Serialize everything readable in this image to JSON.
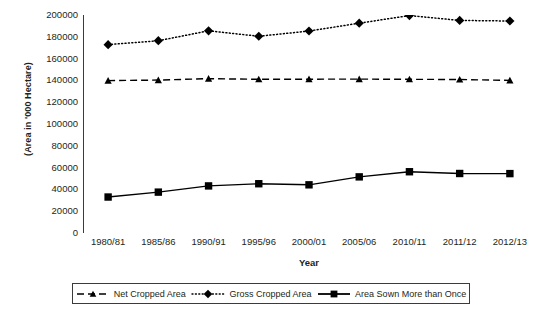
{
  "chart_data": {
    "type": "line",
    "title": "",
    "xlabel": "Year",
    "ylabel": "(Area in '000 Hectare)",
    "categories": [
      "1980/81",
      "1985/86",
      "1990/91",
      "1995/96",
      "2000/01",
      "2005/06",
      "2010/11",
      "2011/12",
      "2012/13"
    ],
    "ylim": [
      0,
      200000
    ],
    "ytick_step": 20000,
    "yticks": [
      "0",
      "20000",
      "40000",
      "60000",
      "80000",
      "100000",
      "120000",
      "140000",
      "160000",
      "180000",
      "200000"
    ],
    "grid": false,
    "legend_position": "bottom",
    "series": [
      {
        "name": "Net Cropped Area",
        "marker": "triangle",
        "linestyle": "dashed",
        "color": "#000000",
        "values": [
          139800,
          140300,
          141600,
          141000,
          141100,
          141200,
          141000,
          140800,
          140000
        ]
      },
      {
        "name": "Gross Cropped Area",
        "marker": "diamond",
        "linestyle": "dotted",
        "color": "#000000",
        "values": [
          172800,
          176400,
          185500,
          180500,
          185300,
          192500,
          199500,
          195000,
          194500
        ]
      },
      {
        "name": "Area Sown More than Once",
        "marker": "square",
        "linestyle": "solid",
        "color": "#000000",
        "values": [
          33000,
          37500,
          43200,
          45200,
          44200,
          51500,
          56200,
          54600,
          54500
        ]
      }
    ]
  },
  "axes": {
    "y_title": "(Area in '000 Hectare)",
    "x_title": "Year"
  },
  "legend": {
    "items": [
      {
        "label": "Net Cropped Area",
        "style": "dashed-triangle"
      },
      {
        "label": "Gross Cropped Area",
        "style": "dotted-diamond"
      },
      {
        "label": "Area Sown More than Once",
        "style": "solid-square"
      }
    ]
  },
  "colors": {
    "axis": "#3b3b3b",
    "series": "#000000",
    "background": "#ffffff"
  }
}
